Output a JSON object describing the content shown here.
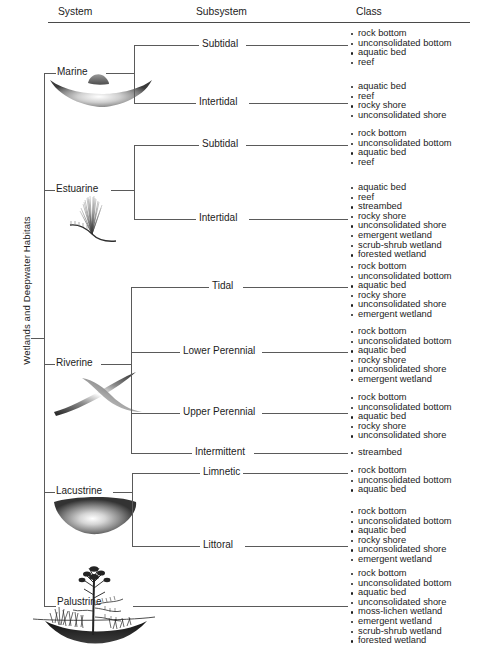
{
  "figure": {
    "vertical_title": "Wetlands and Deepwater Habitats",
    "columns": [
      {
        "label": "System"
      },
      {
        "label": "Subsystem"
      },
      {
        "label": "Class"
      }
    ]
  },
  "chart_data": {
    "type": "tree",
    "title": "Wetlands and Deepwater Habitats",
    "levels": [
      "System",
      "Subsystem",
      "Class"
    ],
    "root": "Wetlands and Deepwater Habitats",
    "systems": [
      {
        "name": "Marine",
        "icon": "marine-basin-illustration",
        "subsystems": [
          {
            "name": "Subtidal",
            "classes": [
              "rock bottom",
              "unconsolidated bottom",
              "aquatic bed",
              "reef"
            ]
          },
          {
            "name": "Intertidal",
            "classes": [
              "aquatic bed",
              "reef",
              "rocky shore",
              "unconsolidated shore"
            ]
          }
        ]
      },
      {
        "name": "Estuarine",
        "icon": "estuarine-marsh-illustration",
        "subsystems": [
          {
            "name": "Subtidal",
            "classes": [
              "rock bottom",
              "unconsolidated bottom",
              "aquatic bed",
              "reef"
            ]
          },
          {
            "name": "Intertidal",
            "classes": [
              "aquatic bed",
              "reef",
              "streambed",
              "rocky shore",
              "unconsolidated shore",
              "emergent wetland",
              "scrub-shrub wetland",
              "forested wetland"
            ]
          }
        ]
      },
      {
        "name": "Riverine",
        "icon": "riverine-channel-illustration",
        "subsystems": [
          {
            "name": "Tidal",
            "classes": [
              "rock bottom",
              "unconsolidated bottom",
              "aquatic bed",
              "rocky shore",
              "unconsolidated shore",
              "emergent wetland"
            ]
          },
          {
            "name": "Lower Perennial",
            "classes": [
              "rock bottom",
              "unconsolidated bottom",
              "aquatic bed",
              "rocky shore",
              "unconsolidated shore",
              "emergent wetland"
            ]
          },
          {
            "name": "Upper Perennial",
            "classes": [
              "rock bottom",
              "unconsolidated bottom",
              "aquatic bed",
              "rocky shore",
              "unconsolidated shore"
            ]
          },
          {
            "name": "Intermittent",
            "classes": [
              "streambed"
            ]
          }
        ]
      },
      {
        "name": "Lacustrine",
        "icon": "lacustrine-lake-illustration",
        "subsystems": [
          {
            "name": "Limnetic",
            "classes": [
              "rock bottom",
              "unconsolidated bottom",
              "aquatic bed"
            ]
          },
          {
            "name": "Littoral",
            "classes": [
              "rock bottom",
              "unconsolidated bottom",
              "aquatic bed",
              "rocky shore",
              "unconsolidated shore",
              "emergent wetland"
            ]
          }
        ]
      },
      {
        "name": "Palustrine",
        "icon": "palustrine-swamp-illustration",
        "subsystems": [
          {
            "name": "",
            "classes": [
              "rock bottom",
              "unconsolidated bottom",
              "aquatic bed",
              "unconsolidated shore",
              "moss-lichen wetland",
              "emergent wetland",
              "scrub-shrub wetland",
              "forested wetland"
            ]
          }
        ]
      }
    ]
  }
}
